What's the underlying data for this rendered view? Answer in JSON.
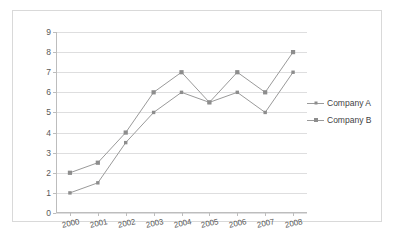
{
  "chart_data": {
    "type": "line",
    "title": "",
    "xlabel": "",
    "ylabel": "",
    "categories": [
      "2000",
      "2001",
      "2002",
      "2003",
      "2004",
      "2005",
      "2006",
      "2007",
      "2008"
    ],
    "x_tick_labels": [
      "2000",
      "2001",
      "2002",
      "2003",
      "2004",
      "2005",
      "2006",
      "2007",
      "2008"
    ],
    "y_tick_labels": [
      "0",
      "1",
      "2",
      "3",
      "4",
      "5",
      "6",
      "7",
      "8",
      "9"
    ],
    "ylim": [
      0,
      9
    ],
    "y_tick_step": 1,
    "grid": "horizontal",
    "legend_position": "right",
    "series": [
      {
        "name": "Company A",
        "marker": "small-square",
        "color": "#8d8d8d",
        "values": [
          1,
          1.5,
          3.5,
          5,
          6,
          5.5,
          6,
          5,
          7
        ]
      },
      {
        "name": "Company B",
        "marker": "square",
        "color": "#8d8d8d",
        "values": [
          2,
          2.5,
          4,
          6,
          7,
          5.5,
          7,
          6,
          8
        ]
      }
    ]
  },
  "legend": {
    "items": [
      {
        "label": "Company A",
        "swatch": "line-small-square-marker"
      },
      {
        "label": "Company B",
        "swatch": "line-square-marker"
      }
    ]
  },
  "colors": {
    "line": "#9a9a9a",
    "marker": "#8d8d8d",
    "gridline": "#dededf",
    "axis": "#bdbdbd",
    "tick_text": "#585858",
    "legend_text": "#3f3f3f",
    "frame": "#d9d9d9",
    "background": "#ffffff"
  }
}
